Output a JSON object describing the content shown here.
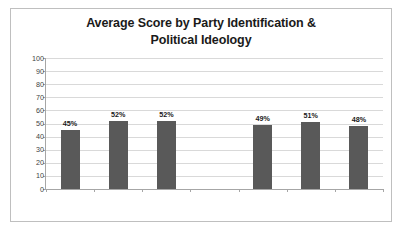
{
  "chart_data": {
    "type": "bar",
    "title": "Average Score by Party Identification & Political Ideology",
    "title_lines": [
      "Average Score by Party Identification &",
      "Political Ideology"
    ],
    "categories": [
      "Democrat",
      "Republican",
      "Independent",
      "",
      "Liberal",
      "Moderate",
      "Conservative"
    ],
    "values": [
      45,
      52,
      52,
      null,
      49,
      51,
      48
    ],
    "data_labels": [
      "45%",
      "52%",
      "52%",
      "",
      "49%",
      "51%",
      "48%"
    ],
    "xlabel": "",
    "ylabel": "",
    "ylim": [
      0,
      100
    ],
    "y_ticks": [
      0,
      10,
      20,
      30,
      40,
      50,
      60,
      70,
      80,
      90,
      100
    ],
    "y_tick_labels": [
      "0",
      "10",
      "20",
      "30",
      "40",
      "50",
      "60",
      "70",
      "80",
      "90",
      "100"
    ],
    "grid": true,
    "grid_axis": "y",
    "legend": false,
    "legend_position": "none",
    "bar_color": "#595959",
    "grid_color": "#d9d9d9",
    "axis_color": "#a6a6a6",
    "border_color": "#bfbfbf",
    "background_color": "#ffffff",
    "text_color": "#3f3f3f",
    "title_color": "#1a1a1a"
  }
}
